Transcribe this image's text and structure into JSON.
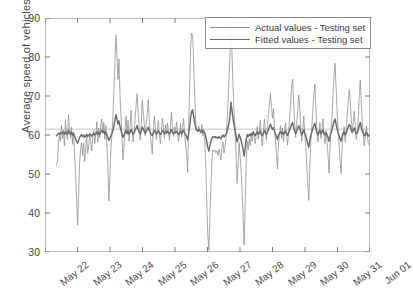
{
  "chart_data": {
    "type": "line",
    "title": "",
    "xlabel": "",
    "ylabel": "Average speed of vehicles",
    "ylim": [
      30,
      90
    ],
    "yticks": [
      30,
      40,
      50,
      60,
      70,
      80,
      90
    ],
    "xticks": [
      "May 22",
      "May 23",
      "May 24",
      "May 25",
      "May 26",
      "May 27",
      "May 28",
      "May 29",
      "May 30",
      "May 31",
      "Jun 01"
    ],
    "grid": false,
    "legend_position": "top-right",
    "reference_line": 61.5,
    "colors": {
      "actual": "#8d8d8d",
      "fitted": "#6b6b6b",
      "axis": "#707070",
      "text": "#3a3a3a"
    },
    "series": [
      {
        "name": "Actual values - Testing set",
        "values": [
          52.3,
          53.1,
          57.8,
          60.2,
          58.4,
          62.6,
          59.1,
          61.3,
          57.2,
          63.9,
          60.4,
          58.8,
          65.2,
          61.1,
          59.3,
          62.0,
          57.6,
          60.8,
          55.1,
          50.2,
          43.6,
          36.9,
          44.2,
          52.8,
          56.3,
          58.1,
          54.7,
          57.9,
          53.2,
          56.4,
          59.8,
          55.3,
          57.1,
          60.2,
          58.6,
          55.9,
          59.4,
          61.2,
          57.8,
          60.1,
          63.4,
          58.2,
          61.7,
          59.3,
          62.8,
          64.1,
          60.6,
          63.2,
          58.9,
          62.4,
          57.3,
          52.1,
          43.1,
          49.8,
          56.2,
          60.3,
          64.7,
          71.2,
          78.4,
          85.6,
          80.1,
          74.3,
          79.5,
          70.2,
          64.8,
          59.3,
          53.6,
          57.2,
          61.4,
          64.9,
          60.2,
          63.8,
          58.4,
          62.1,
          66.3,
          61.7,
          58.2,
          60.9,
          64.2,
          67.8,
          70.6,
          65.3,
          61.9,
          58.7,
          62.4,
          68.9,
          66.2,
          63.1,
          59.8,
          62.7,
          65.4,
          69.1,
          64.3,
          60.2,
          57.4,
          55.1,
          61.3,
          64.8,
          62.2,
          58.9,
          61.4,
          63.7,
          60.1,
          57.8,
          61.2,
          64.3,
          61.8,
          59.2,
          62.6,
          60.4,
          63.1,
          61.2,
          58.6,
          62.3,
          65.8,
          61.4,
          59.7,
          62.1,
          60.8,
          63.4,
          61.1,
          58.3,
          60.7,
          62.9,
          59.4,
          61.8,
          64.2,
          60.3,
          57.6,
          55.2,
          50.4,
          62.1,
          72.3,
          82.6,
          86.1,
          85.4,
          78.2,
          70.1,
          63.4,
          61.2,
          60.8,
          62.4,
          61.1,
          60.3,
          62.7,
          59.8,
          61.4,
          58.2,
          52.1,
          42.3,
          34.1,
          30.4,
          38.2,
          46.7,
          53.1,
          56.2,
          55.8,
          56.1,
          55.4,
          55.9,
          54.8,
          56.3,
          55.1,
          53.6,
          56.8,
          58.2,
          55.4,
          57.1,
          59.3,
          62.8,
          68.4,
          74.2,
          81.3,
          87.6,
          80.2,
          72.4,
          66.1,
          60.8,
          55.2,
          47.6,
          52.3,
          58.1,
          54.2,
          50.8,
          45.2,
          38.4,
          31.8,
          42.6,
          53.1,
          58.4,
          56.2,
          59.1,
          57.3,
          60.2,
          58.4,
          61.1,
          59.3,
          57.8,
          60.4,
          62.2,
          58.9,
          61.3,
          63.8,
          59.4,
          57.2,
          60.8,
          64.1,
          61.2,
          58.6,
          62.4,
          65.3,
          68.2,
          70.6,
          67.1,
          64.3,
          66.8,
          62.1,
          58.4,
          55.2,
          51.3,
          57.8,
          60.2,
          62.4,
          59.1,
          61.8,
          58.3,
          60.9,
          63.2,
          59.7,
          57.4,
          61.1,
          64.3,
          68.2,
          72.4,
          74.3,
          68.1,
          63.2,
          59.4,
          62.8,
          66.1,
          70.2,
          67.3,
          62.1,
          58.4,
          61.2,
          64.8,
          60.3,
          57.2,
          52.1,
          47.4,
          43.2,
          51.6,
          58.3,
          62.1,
          66.4,
          70.2,
          73.1,
          67.2,
          61.4,
          58.2,
          60.8,
          63.2,
          59.1,
          61.4,
          64.2,
          60.3,
          57.8,
          61.2,
          58.4,
          55.1,
          50.2,
          56.3,
          61.2,
          64.8,
          70.3,
          75.2,
          78.4,
          72.1,
          66.3,
          61.2,
          57.4,
          53.2,
          50.1,
          56.8,
          60.4,
          62.1,
          58.3,
          61.2,
          64.8,
          68.2,
          71.6,
          69.2,
          64.3,
          60.8,
          63.2,
          66.1,
          62.4,
          58.9,
          61.2,
          64.3,
          70.2,
          74.1,
          68.2,
          63.4,
          60.1,
          57.2,
          59.8,
          62.3,
          60.1,
          57.6
        ]
      },
      {
        "name": "Fitted values - Testing set",
        "values": [
          59.8,
          60.1,
          60.4,
          60.2,
          60.6,
          60.3,
          60.8,
          60.5,
          60.2,
          60.9,
          60.4,
          60.1,
          61.2,
          60.6,
          60.2,
          60.8,
          59.9,
          60.4,
          59.6,
          59.1,
          58.4,
          57.9,
          58.6,
          59.4,
          59.8,
          60.1,
          59.6,
          60.0,
          59.4,
          59.8,
          60.2,
          59.6,
          59.9,
          60.3,
          60.1,
          59.7,
          60.2,
          60.4,
          60.0,
          60.3,
          60.8,
          60.1,
          60.6,
          60.2,
          60.9,
          61.2,
          60.6,
          61.0,
          60.2,
          60.8,
          60.1,
          59.4,
          58.6,
          59.2,
          59.8,
          60.4,
          61.2,
          62.4,
          63.8,
          65.2,
          64.1,
          62.8,
          63.6,
          62.1,
          61.2,
          60.3,
          59.4,
          60.0,
          60.6,
          61.2,
          60.4,
          61.0,
          60.2,
          60.8,
          61.4,
          60.7,
          60.2,
          60.6,
          61.2,
          61.8,
          62.4,
          61.4,
          60.8,
          60.2,
          60.9,
          62.1,
          61.6,
          61.0,
          60.4,
          60.9,
          61.4,
          62.0,
          61.2,
          60.6,
          60.1,
          59.8,
          60.6,
          61.2,
          60.8,
          60.2,
          60.7,
          61.1,
          60.5,
          60.1,
          60.6,
          61.1,
          60.8,
          60.3,
          60.9,
          60.5,
          61.0,
          60.6,
          60.2,
          60.8,
          61.4,
          60.7,
          60.3,
          60.8,
          60.5,
          61.0,
          60.6,
          60.1,
          60.5,
          61.0,
          60.3,
          60.8,
          61.3,
          60.5,
          60.1,
          59.6,
          58.8,
          60.4,
          62.2,
          64.6,
          66.1,
          66.4,
          64.8,
          63.1,
          61.8,
          61.2,
          61.0,
          61.4,
          61.1,
          60.8,
          61.3,
          60.6,
          61.0,
          60.4,
          59.6,
          58.2,
          56.8,
          55.9,
          57.2,
          58.4,
          59.2,
          59.6,
          59.4,
          59.6,
          59.3,
          59.5,
          59.2,
          59.6,
          59.3,
          59.0,
          59.7,
          60.0,
          59.5,
          59.8,
          60.2,
          60.8,
          61.9,
          63.2,
          65.1,
          68.4,
          66.2,
          64.1,
          62.6,
          61.2,
          59.8,
          58.2,
          59.1,
          60.2,
          59.4,
          58.6,
          57.4,
          56.1,
          54.6,
          56.8,
          58.9,
          60.1,
          59.6,
          60.2,
          59.8,
          60.4,
          60.0,
          60.7,
          60.2,
          59.8,
          60.4,
          60.8,
          60.1,
          60.6,
          61.1,
          60.2,
          59.8,
          60.5,
          61.2,
          60.6,
          60.1,
          60.8,
          61.4,
          62.1,
          62.8,
          62.0,
          61.4,
          61.9,
          61.0,
          60.2,
          59.6,
          58.8,
          60.0,
          60.5,
          60.9,
          60.3,
          60.8,
          60.1,
          60.6,
          61.1,
          60.4,
          59.9,
          60.6,
          61.2,
          62.0,
          62.8,
          63.2,
          61.9,
          61.0,
          60.3,
          60.9,
          61.6,
          62.4,
          61.8,
          60.8,
          60.0,
          60.6,
          61.3,
          60.4,
          59.8,
          58.8,
          57.8,
          56.9,
          58.6,
          59.9,
          60.7,
          61.6,
          62.4,
          63.0,
          61.8,
          60.6,
          60.0,
          60.6,
          61.2,
          60.3,
          60.7,
          61.3,
          60.5,
          60.0,
          60.6,
          60.1,
          59.4,
          58.4,
          59.6,
          60.6,
          61.3,
          62.4,
          63.4,
          64.1,
          62.8,
          61.6,
          60.6,
          59.8,
          59.0,
          58.4,
          59.7,
          60.4,
          60.8,
          60.0,
          60.6,
          61.3,
          62.0,
          62.7,
          62.3,
          61.3,
          60.6,
          61.2,
          61.8,
          61.0,
          60.3,
          60.6,
          61.3,
          62.4,
          63.2,
          62.0,
          61.0,
          60.4,
          59.8,
          60.2,
          60.7,
          60.3,
          59.7
        ]
      }
    ]
  },
  "legend": {
    "items": [
      {
        "label": "Actual values - Testing set"
      },
      {
        "label": "Fitted values - Testing set"
      }
    ]
  }
}
